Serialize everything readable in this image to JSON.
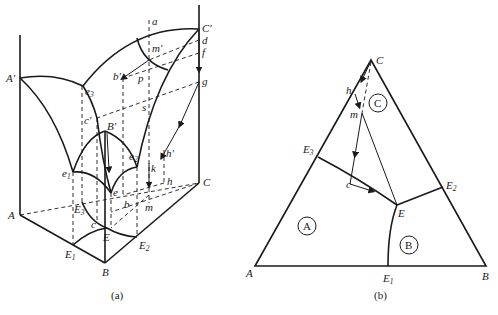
{
  "figure_a": {
    "caption": "(a)",
    "labels": {
      "A_prime": "A'",
      "C_prime": "C'",
      "B_prime": "B'",
      "A": "A",
      "B": "B",
      "C": "C",
      "a": "a",
      "d": "d",
      "f": "f",
      "g": "g",
      "m_prime": "m'",
      "b_prime": "b'",
      "p": "p",
      "s": "s",
      "c_prime": "c'",
      "h_prime": "h'",
      "k": "k",
      "h": "h",
      "m": "m",
      "b": "b",
      "c": "c",
      "e": "e",
      "e1": "e",
      "e1_sub": "1",
      "e2": "e",
      "e2_sub": "2",
      "e3": "e",
      "e3_sub": "3",
      "E": "E",
      "E1": "E",
      "E1_sub": "1",
      "E2": "E",
      "E2_sub": "2",
      "E3": "E",
      "E3_sub": "3"
    }
  },
  "figure_b": {
    "caption": "(b)",
    "labels": {
      "A": "A",
      "B": "B",
      "C": "C",
      "h": "h",
      "m": "m",
      "c": "c",
      "E": "E",
      "E1": "E",
      "E1_sub": "1",
      "E2": "E",
      "E2_sub": "2",
      "E3": "E",
      "E3_sub": "3"
    },
    "regions": {
      "A": "A",
      "B": "B",
      "C": "C"
    }
  },
  "colors": {
    "line": "#1a1a1a",
    "background": "#ffffff"
  }
}
